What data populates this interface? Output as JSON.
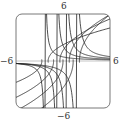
{
  "chart_data": {
    "type": "line",
    "title": "",
    "xlabel": "",
    "ylabel": "",
    "xlim": [
      -6,
      6
    ],
    "ylim": [
      -6,
      6
    ],
    "grid": false,
    "legend": null,
    "tick_labels": {
      "x_min": "−6",
      "x_max": "6",
      "y_min": "−6",
      "y_max": "6"
    },
    "series": [
      {
        "name": "curve-1",
        "asymptote_x": -2.3
      },
      {
        "name": "curve-2",
        "asymptote_x": -0.8
      },
      {
        "name": "curve-3",
        "asymptote_x": 0.4
      },
      {
        "name": "curve-4",
        "asymptote_x": 1.7
      }
    ],
    "horizontal_asymptote_y": 0
  },
  "labels": {
    "top": "6",
    "bottom": "−6",
    "left": "−6",
    "right": "6"
  }
}
